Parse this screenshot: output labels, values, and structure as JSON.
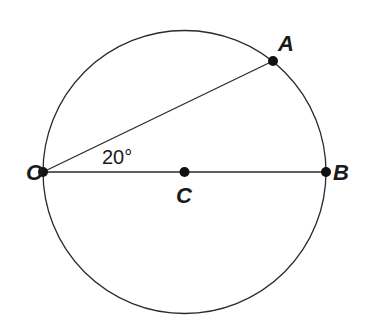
{
  "diagram": {
    "type": "geometry-circle",
    "circle": {
      "center_label": "C",
      "cx": 184.5,
      "cy": 172,
      "r": 141.5
    },
    "points": [
      {
        "id": "O",
        "label": "O",
        "x": 43,
        "y": 172,
        "label_x": 26,
        "label_y": 180
      },
      {
        "id": "A",
        "label": "A",
        "x": 273,
        "y": 61,
        "label_x": 278,
        "label_y": 51
      },
      {
        "id": "B",
        "label": "B",
        "x": 326,
        "y": 172,
        "label_x": 333,
        "label_y": 180
      },
      {
        "id": "C",
        "label": "C",
        "x": 184.5,
        "y": 172,
        "label_x": 176,
        "label_y": 203
      }
    ],
    "segments": [
      {
        "from": "O",
        "to": "A",
        "name": "chord-OA"
      },
      {
        "from": "O",
        "to": "B",
        "name": "diameter-OB"
      }
    ],
    "angle": {
      "vertex": "O",
      "between": [
        "OA",
        "OB"
      ],
      "text": "20°",
      "label_x": 102,
      "label_y": 164
    },
    "colors": {
      "stroke": "#2a2a2a",
      "point": "#111111",
      "text": "#1a1a1a",
      "background": "#ffffff"
    }
  }
}
